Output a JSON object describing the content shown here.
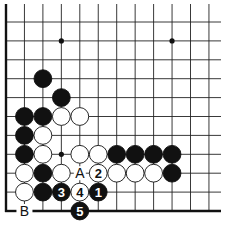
{
  "diagram": {
    "grid": {
      "x0": 6,
      "y0": 22,
      "dx": 18.45,
      "dy": 18.9,
      "cols": 12,
      "rows": 10,
      "left_edge_x": 6,
      "bottom_edge_y": 211,
      "line_top": 4,
      "line_right": 221
    },
    "star_points": [
      {
        "c": 3,
        "r": 1
      },
      {
        "c": 9,
        "r": 1
      },
      {
        "c": 3,
        "r": 7
      }
    ],
    "stones": [
      {
        "color": "black",
        "c": 2,
        "r": 3,
        "label": ""
      },
      {
        "color": "black",
        "c": 3,
        "r": 4,
        "label": ""
      },
      {
        "color": "black",
        "c": 1,
        "r": 5,
        "label": ""
      },
      {
        "color": "black",
        "c": 2,
        "r": 5,
        "label": ""
      },
      {
        "color": "white",
        "c": 3,
        "r": 5,
        "label": ""
      },
      {
        "color": "white",
        "c": 4,
        "r": 5,
        "label": ""
      },
      {
        "color": "black",
        "c": 1,
        "r": 6,
        "label": ""
      },
      {
        "color": "white",
        "c": 2,
        "r": 6,
        "label": ""
      },
      {
        "color": "black",
        "c": 1,
        "r": 7,
        "label": ""
      },
      {
        "color": "white",
        "c": 2,
        "r": 7,
        "label": ""
      },
      {
        "color": "white",
        "c": 4,
        "r": 7,
        "label": ""
      },
      {
        "color": "white",
        "c": 5,
        "r": 7,
        "label": ""
      },
      {
        "color": "black",
        "c": 6,
        "r": 7,
        "label": ""
      },
      {
        "color": "black",
        "c": 7,
        "r": 7,
        "label": ""
      },
      {
        "color": "black",
        "c": 8,
        "r": 7,
        "label": ""
      },
      {
        "color": "black",
        "c": 9,
        "r": 7,
        "label": ""
      },
      {
        "color": "white",
        "c": 1,
        "r": 8,
        "label": ""
      },
      {
        "color": "black",
        "c": 2,
        "r": 8,
        "label": ""
      },
      {
        "color": "white",
        "c": 3,
        "r": 8,
        "label": ""
      },
      {
        "color": "white",
        "c": 5,
        "r": 8,
        "label": "2"
      },
      {
        "color": "white",
        "c": 6,
        "r": 8,
        "label": ""
      },
      {
        "color": "white",
        "c": 7,
        "r": 8,
        "label": ""
      },
      {
        "color": "white",
        "c": 8,
        "r": 8,
        "label": ""
      },
      {
        "color": "black",
        "c": 9,
        "r": 8,
        "label": ""
      },
      {
        "color": "white",
        "c": 1,
        "r": 9,
        "label": ""
      },
      {
        "color": "black",
        "c": 2,
        "r": 9,
        "label": ""
      },
      {
        "color": "black",
        "c": 3,
        "r": 9,
        "label": "3"
      },
      {
        "color": "white",
        "c": 4,
        "r": 9,
        "label": "4"
      },
      {
        "color": "black",
        "c": 5,
        "r": 9,
        "label": "1"
      },
      {
        "color": "black",
        "c": 4,
        "r": 10,
        "label": "5"
      }
    ],
    "point_labels": [
      {
        "text": "A",
        "c": 4,
        "r": 8
      },
      {
        "text": "B",
        "c": 1,
        "r": 10
      }
    ],
    "colors": {
      "line": "#222222",
      "edge": "#111111",
      "black_stone": "#111111",
      "white_stone": "#ffffff",
      "background": "#ffffff"
    }
  }
}
